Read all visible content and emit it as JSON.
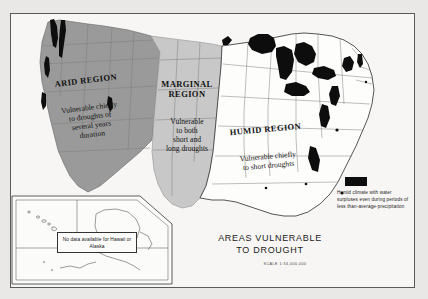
{
  "figure": {
    "title": "AREAS VULNERABLE\nTO DROUGHT",
    "scale": "SCALE 1:34,000,000"
  },
  "regions": [
    {
      "id": "arid",
      "name": "ARID REGION",
      "description": "Vulnerable chiefly\nto droughts of\nseveral years\nduration",
      "fill": "#9a9a9a"
    },
    {
      "id": "marginal",
      "name": "MARGINAL\nREGION",
      "description": "Vulnerable\nto both\nshort and\nlong droughts",
      "fill": "#c8c8c8"
    },
    {
      "id": "humid",
      "name": "HUMID REGION",
      "description": "Vulnerable chiefly\nto short droughts",
      "fill": "#fdfdfc"
    }
  ],
  "legend": {
    "swatch_color": "#0d0d0d",
    "text": "Humid climate with water surpluses even during periods of less than-average-precipitation"
  },
  "inset": {
    "note": "No data available\nfor Hawaii or Alaska"
  },
  "colors": {
    "frame": "#5a5a5a",
    "background": "#e9e8e6",
    "paper": "#f7f6f4",
    "state_line": "#7d7d7d",
    "coast_line": "#2b2b2b",
    "black_patch": "#0d0d0d"
  }
}
